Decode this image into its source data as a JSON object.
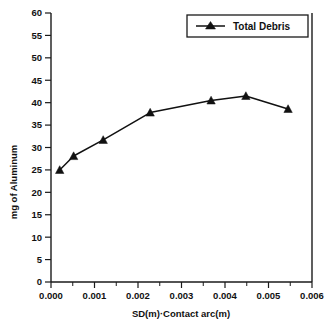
{
  "chart_data": {
    "type": "line",
    "title": "",
    "xlabel": "SD(m)·Contact arc(m)",
    "ylabel": "mg of Aluminum",
    "xlim": [
      0.0,
      0.006
    ],
    "ylim": [
      0,
      60
    ],
    "grid": false,
    "legend_position": "top-right",
    "x_ticks": [
      "0.000",
      "0.001",
      "0.002",
      "0.003",
      "0.004",
      "0.005",
      "0.006"
    ],
    "x_tick_values": [
      0.0,
      0.001,
      0.002,
      0.003,
      0.004,
      0.005,
      0.006
    ],
    "x_minor_tick_values": [
      0.0005,
      0.0015,
      0.0025,
      0.0035,
      0.0045,
      0.0055
    ],
    "y_ticks": [
      "0",
      "5",
      "10",
      "15",
      "20",
      "25",
      "30",
      "35",
      "40",
      "45",
      "50",
      "55",
      "60"
    ],
    "y_tick_values": [
      0,
      5,
      10,
      15,
      20,
      25,
      30,
      35,
      40,
      45,
      50,
      55,
      60
    ],
    "series": [
      {
        "name": "Total Debris",
        "marker": "triangle",
        "color": "#111111",
        "x": [
          0.0002,
          0.00052,
          0.0012,
          0.00228,
          0.00368,
          0.00448,
          0.00545
        ],
        "values": [
          25.0,
          28.1,
          31.7,
          37.8,
          40.5,
          41.5,
          38.6
        ]
      }
    ]
  },
  "legend": {
    "entries": [
      {
        "label": "Total Debris",
        "marker": "triangle-icon"
      }
    ]
  },
  "axes": {
    "x_title": "SD(m)·Contact arc(m)",
    "y_title": "mg of Aluminum"
  }
}
